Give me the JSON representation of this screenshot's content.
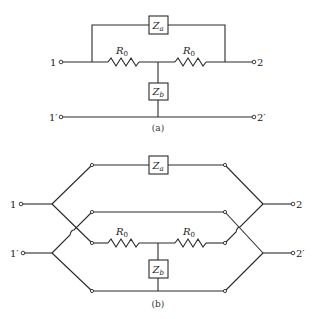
{
  "figure_a": {
    "caption": "(a)",
    "terminals": {
      "in_top": "1",
      "out_top": "2",
      "in_bottom": "1′",
      "out_bottom": "2′"
    },
    "components": {
      "bridge_impedance": {
        "symbol": "Z",
        "subscript": "a"
      },
      "shunt_impedance": {
        "symbol": "Z",
        "subscript": "b"
      },
      "resistor_left": {
        "symbol": "R",
        "subscript": "0"
      },
      "resistor_right": {
        "symbol": "R",
        "subscript": "0"
      }
    }
  },
  "figure_b": {
    "caption": "(b)",
    "terminals": {
      "in_top": "1",
      "out_top": "2",
      "in_bottom": "1′",
      "out_bottom": "2′"
    },
    "components": {
      "bridge_impedance": {
        "symbol": "Z",
        "subscript": "a"
      },
      "shunt_impedance": {
        "symbol": "Z",
        "subscript": "b"
      },
      "resistor_left": {
        "symbol": "R",
        "subscript": "0"
      },
      "resistor_right": {
        "symbol": "R",
        "subscript": "0"
      }
    }
  }
}
